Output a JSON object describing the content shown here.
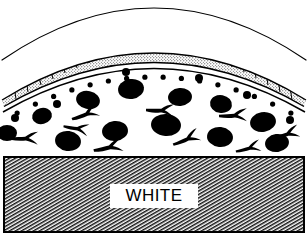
{
  "figure": {
    "width": 308,
    "height": 245,
    "background_color": "#ffffff",
    "ink_color": "#000000"
  },
  "labels": {
    "substrate_label": "WHITE"
  },
  "layers": [
    {
      "name": "outer-arc",
      "description": "thin single outer curved line (outermost boundary)",
      "stroke_color": "#000000",
      "stroke_width": 1.1
    },
    {
      "name": "epithelial-cell-band",
      "description": "arc-following band of stippled rectangular cells bounded by two arc lines",
      "cell_count": 26,
      "fill": "stipple",
      "stroke_color": "#000000"
    },
    {
      "name": "basement-arc",
      "description": "arc line directly under the cell band",
      "stroke_color": "#000000",
      "stroke_width": 1.4
    },
    {
      "name": "small-dot-row",
      "description": "row of small solid black dots following the arc beneath the basement line",
      "dot_count": 16,
      "fill_color": "#000000"
    },
    {
      "name": "stroma-region",
      "description": "open white region containing large black blobs and branched Y-shaped cells",
      "blob_count": 18,
      "branched_cell_count": 9,
      "fill_color": "#000000"
    },
    {
      "name": "substrate-block",
      "description": "rectangular block filled with diagonal hatch lines, labelled WHITE",
      "hatch_angle_deg": 60,
      "hatch_spacing": 3,
      "stroke_color": "#000000",
      "border_width": 2
    }
  ],
  "chart_data": {
    "type": "diagram",
    "outer_arc": {
      "x1": 2,
      "y1": 58,
      "cx": 154,
      "cy": -42,
      "x2": 306,
      "y2": 58
    },
    "cell_band": {
      "outer": {
        "x1": 2,
        "y1": 100,
        "cx": 154,
        "cy": 6,
        "x2": 306,
        "y2": 100
      },
      "inner": {
        "x1": 4,
        "y1": 106,
        "cx": 154,
        "cy": 18,
        "x2": 304,
        "y2": 106
      },
      "cells": 26
    },
    "basement_arc": {
      "x1": 3,
      "y1": 110,
      "cx": 154,
      "cy": 24,
      "x2": 305,
      "y2": 110
    },
    "dot_row": {
      "arc": {
        "x1": 8,
        "y1": 118,
        "cx": 154,
        "cy": 36,
        "x2": 300,
        "y2": 118
      },
      "radius": 2.6,
      "count": 16
    },
    "blobs": [
      {
        "cx": 131,
        "cy": 89,
        "rx": 13,
        "ry": 10,
        "rot": -8
      },
      {
        "cx": 88,
        "cy": 100,
        "rx": 12,
        "ry": 9,
        "rot": 12
      },
      {
        "cx": 180,
        "cy": 97,
        "rx": 12,
        "ry": 9,
        "rot": -5
      },
      {
        "cx": 42,
        "cy": 116,
        "rx": 10,
        "ry": 8,
        "rot": -14
      },
      {
        "cx": 221,
        "cy": 104,
        "rx": 11,
        "ry": 9,
        "rot": 10
      },
      {
        "cx": 115,
        "cy": 131,
        "rx": 13,
        "ry": 10,
        "rot": -6
      },
      {
        "cx": 166,
        "cy": 125,
        "rx": 15,
        "ry": 11,
        "rot": 4
      },
      {
        "cx": 68,
        "cy": 141,
        "rx": 13,
        "ry": 10,
        "rot": 8
      },
      {
        "cx": 263,
        "cy": 122,
        "rx": 13,
        "ry": 10,
        "rot": -10
      },
      {
        "cx": 220,
        "cy": 137,
        "rx": 13,
        "ry": 10,
        "rot": 6
      },
      {
        "cx": 7,
        "cy": 133,
        "rx": 10,
        "ry": 8,
        "rot": 0
      },
      {
        "cx": 277,
        "cy": 143,
        "rx": 12,
        "ry": 9,
        "rot": -8
      },
      {
        "cx": 15,
        "cy": 118,
        "rx": 4,
        "ry": 4,
        "rot": 0
      },
      {
        "cx": 57,
        "cy": 104,
        "rx": 4,
        "ry": 4,
        "rot": 0
      },
      {
        "cx": 290,
        "cy": 120,
        "rx": 4,
        "ry": 4,
        "rot": 0
      },
      {
        "cx": 126,
        "cy": 72,
        "rx": 4,
        "ry": 4,
        "rot": 0
      },
      {
        "cx": 199,
        "cy": 78,
        "rx": 4,
        "ry": 4,
        "rot": 0
      },
      {
        "cx": 247,
        "cy": 95,
        "rx": 4,
        "ry": 4,
        "rot": 0
      }
    ],
    "branched_cells": [
      {
        "cx": 85,
        "cy": 114,
        "rot": -12,
        "s": 1.0
      },
      {
        "cx": 24,
        "cy": 138,
        "rot": 8,
        "s": 1.0
      },
      {
        "cx": 108,
        "cy": 147,
        "rot": -4,
        "s": 1.05
      },
      {
        "cx": 160,
        "cy": 110,
        "rot": 10,
        "s": 1.0
      },
      {
        "cx": 186,
        "cy": 139,
        "rot": -14,
        "s": 1.0
      },
      {
        "cx": 233,
        "cy": 115,
        "rot": 6,
        "s": 1.0
      },
      {
        "cx": 286,
        "cy": 134,
        "rot": -8,
        "s": 0.95
      },
      {
        "cx": 76,
        "cy": 128,
        "rot": 18,
        "s": 0.9
      },
      {
        "cx": 248,
        "cy": 148,
        "rot": -6,
        "s": 0.9
      }
    ],
    "substrate_block": {
      "x": 4,
      "y": 157,
      "width": 300,
      "height": 75
    },
    "substrate_text": {
      "x": 154,
      "y": 201,
      "text": "WHITE"
    }
  }
}
